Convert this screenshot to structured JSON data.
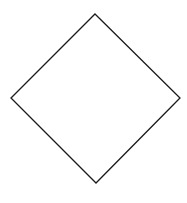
{
  "diagram": {
    "shape": "diamond",
    "fill": "#ffffff",
    "stroke": "#1a1a1a",
    "stroke_width": 1.3,
    "vertices": {
      "top": [
        95,
        14
      ],
      "right": [
        180,
        98
      ],
      "bottom": [
        96,
        183
      ],
      "left": [
        11,
        98
      ]
    }
  }
}
